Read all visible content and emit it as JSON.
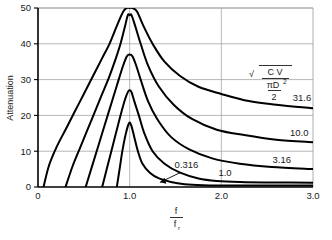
{
  "chart_data": {
    "type": "line",
    "title": "",
    "xlabel": "f/f_r",
    "xlabel_num": "f",
    "xlabel_den": "f",
    "xlabel_den_sub": "r",
    "ylabel": "Attenuation",
    "xlim": [
      0,
      3.0
    ],
    "ylim": [
      0,
      50
    ],
    "xticks": [
      "0",
      "1.0",
      "2.0",
      "3.0"
    ],
    "xtick_values": [
      0,
      1.0,
      2.0,
      3.0
    ],
    "yticks": [
      "0",
      "10",
      "20",
      "30",
      "40",
      "50"
    ],
    "ytick_values": [
      0,
      10,
      20,
      30,
      40,
      50
    ],
    "grid": true,
    "grid_color": "#999999",
    "curve_color": "#000000",
    "legend_position": "inline-right",
    "parameter_formula": "sqrt(C V / (pi D^2 / 2))",
    "formula_parts": {
      "radical": "√",
      "numerator": "C V",
      "denominator_top": "πD",
      "denominator_exp": "2",
      "denominator_bottom": "2"
    },
    "annotation": {
      "label": "0.316",
      "has_leader_line": true,
      "points_to_curve": "0.316"
    },
    "series": [
      {
        "name": "31.6",
        "label": "31.6",
        "label_x": 2.88,
        "label_y": 24.0,
        "peak_y": 50,
        "peak_x": 1.0,
        "left_start_x": 0.06,
        "right_end_y": 22.0,
        "points": [
          [
            0.06,
            0
          ],
          [
            0.12,
            6
          ],
          [
            0.2,
            11
          ],
          [
            0.3,
            16
          ],
          [
            0.4,
            21
          ],
          [
            0.5,
            26
          ],
          [
            0.6,
            31
          ],
          [
            0.7,
            36
          ],
          [
            0.78,
            40
          ],
          [
            0.86,
            45
          ],
          [
            0.93,
            49
          ],
          [
            0.97,
            50
          ],
          [
            1.0,
            50
          ],
          [
            1.03,
            50
          ],
          [
            1.08,
            49
          ],
          [
            1.15,
            45
          ],
          [
            1.25,
            40
          ],
          [
            1.38,
            35
          ],
          [
            1.55,
            31
          ],
          [
            1.75,
            28
          ],
          [
            2.0,
            26
          ],
          [
            2.3,
            24
          ],
          [
            2.6,
            23
          ],
          [
            3.0,
            22
          ]
        ]
      },
      {
        "name": "10.0",
        "label": "10.0",
        "label_x": 2.85,
        "label_y": 14.2,
        "peak_y": 48,
        "peak_x": 1.0,
        "left_start_x": 0.3,
        "right_end_y": 12.5,
        "points": [
          [
            0.3,
            0
          ],
          [
            0.38,
            6
          ],
          [
            0.46,
            11
          ],
          [
            0.54,
            16
          ],
          [
            0.62,
            21
          ],
          [
            0.7,
            26
          ],
          [
            0.78,
            31
          ],
          [
            0.85,
            36
          ],
          [
            0.9,
            40
          ],
          [
            0.95,
            45
          ],
          [
            0.98,
            48
          ],
          [
            1.0,
            48
          ],
          [
            1.02,
            48
          ],
          [
            1.06,
            45
          ],
          [
            1.12,
            40
          ],
          [
            1.2,
            34
          ],
          [
            1.32,
            28
          ],
          [
            1.48,
            23
          ],
          [
            1.68,
            19
          ],
          [
            1.95,
            16
          ],
          [
            2.25,
            14.5
          ],
          [
            2.6,
            13.2
          ],
          [
            3.0,
            12.5
          ]
        ]
      },
      {
        "name": "3.16",
        "label": "3.16",
        "label_x": 2.66,
        "label_y": 6.6,
        "peak_y": 37,
        "peak_x": 1.0,
        "left_start_x": 0.52,
        "right_end_y": 5.0,
        "points": [
          [
            0.52,
            0
          ],
          [
            0.58,
            5
          ],
          [
            0.64,
            10
          ],
          [
            0.7,
            15
          ],
          [
            0.76,
            20
          ],
          [
            0.82,
            25
          ],
          [
            0.88,
            30
          ],
          [
            0.93,
            34
          ],
          [
            0.97,
            36.5
          ],
          [
            1.0,
            37
          ],
          [
            1.03,
            36.5
          ],
          [
            1.07,
            34
          ],
          [
            1.12,
            30
          ],
          [
            1.2,
            24
          ],
          [
            1.3,
            19
          ],
          [
            1.45,
            14
          ],
          [
            1.65,
            10.5
          ],
          [
            1.9,
            8
          ],
          [
            2.2,
            6.5
          ],
          [
            2.55,
            5.6
          ],
          [
            3.0,
            5.0
          ]
        ]
      },
      {
        "name": "1.0",
        "label": "1.0",
        "label_x": 2.04,
        "label_y": 3.0,
        "peak_y": 27,
        "peak_x": 1.0,
        "left_start_x": 0.7,
        "right_end_y": 1.2,
        "points": [
          [
            0.7,
            0
          ],
          [
            0.75,
            5
          ],
          [
            0.8,
            10
          ],
          [
            0.85,
            15
          ],
          [
            0.9,
            20
          ],
          [
            0.95,
            24.5
          ],
          [
            0.98,
            26.5
          ],
          [
            1.0,
            27
          ],
          [
            1.02,
            26.5
          ],
          [
            1.05,
            24
          ],
          [
            1.1,
            20
          ],
          [
            1.16,
            15
          ],
          [
            1.25,
            10
          ],
          [
            1.38,
            6.5
          ],
          [
            1.55,
            4
          ],
          [
            1.75,
            2.4
          ],
          [
            1.95,
            1.7
          ],
          [
            2.2,
            1.4
          ],
          [
            2.6,
            1.25
          ],
          [
            3.0,
            1.2
          ]
        ]
      },
      {
        "name": "0.316",
        "label": "0.316",
        "label_x": 1.62,
        "label_y": 5.2,
        "peak_y": 18,
        "peak_x": 1.0,
        "left_start_x": 0.86,
        "right_end_y": 0.4,
        "points": [
          [
            0.86,
            0
          ],
          [
            0.89,
            5
          ],
          [
            0.92,
            10
          ],
          [
            0.95,
            14
          ],
          [
            0.98,
            17
          ],
          [
            1.0,
            18
          ],
          [
            1.02,
            17
          ],
          [
            1.05,
            14
          ],
          [
            1.09,
            10
          ],
          [
            1.14,
            6.5
          ],
          [
            1.22,
            4
          ],
          [
            1.32,
            2.4
          ],
          [
            1.45,
            1.4
          ],
          [
            1.6,
            0.8
          ],
          [
            1.8,
            0.5
          ],
          [
            2.0,
            0.42
          ],
          [
            2.4,
            0.4
          ],
          [
            3.0,
            0.4
          ]
        ]
      }
    ]
  },
  "plot_geometry": {
    "left": 38,
    "top": 8,
    "right": 313,
    "bottom": 187
  }
}
